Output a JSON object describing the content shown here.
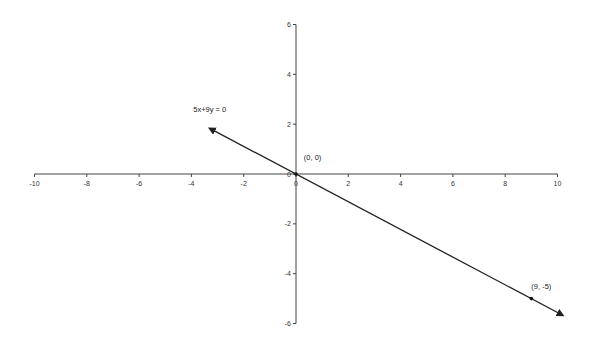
{
  "chart_data": {
    "type": "line",
    "title": "",
    "xlabel": "",
    "ylabel": "",
    "xlim": [
      -10,
      10
    ],
    "ylim": [
      -6,
      6
    ],
    "grid": false,
    "x_ticks": [
      "-10",
      "-8",
      "-6",
      "-4",
      "-2",
      "0",
      "2",
      "4",
      "6",
      "8",
      "10"
    ],
    "y_ticks": [
      "6",
      "4",
      "2",
      "0",
      "-2",
      "-4",
      "-6"
    ],
    "series": [
      {
        "name": "5x+9y = 0",
        "equation": "5x+9y = 0",
        "x": [
          -3.3,
          0,
          9,
          10.2
        ],
        "y": [
          1.83,
          0,
          -5,
          -5.67
        ],
        "arrows": "both"
      }
    ],
    "annotations": [
      {
        "text": "5x+9y = 0",
        "x": -3.3,
        "y": 2.5
      },
      {
        "text": "(0, 0)",
        "x": 0.3,
        "y": 0.55
      },
      {
        "text": "(9, -5)",
        "x": 9.0,
        "y": -4.6
      }
    ],
    "points": [
      {
        "label": "(0, 0)",
        "x": 0,
        "y": 0
      },
      {
        "label": "(9, -5)",
        "x": 9,
        "y": -5
      }
    ]
  }
}
